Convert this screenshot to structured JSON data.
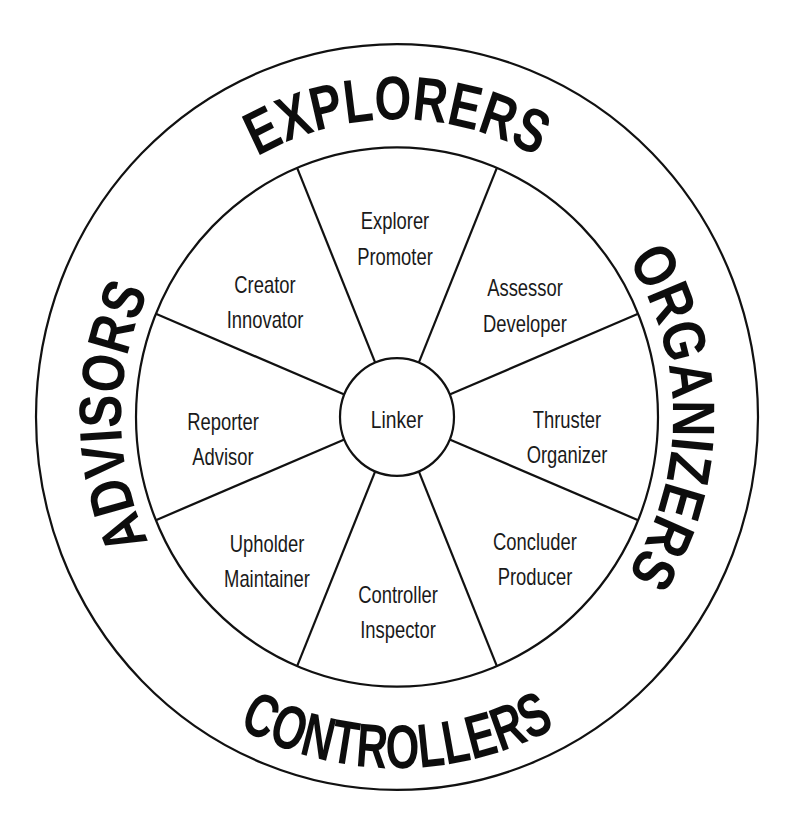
{
  "diagram": {
    "center": {
      "label": "Linker"
    },
    "groups": [
      {
        "id": "explorers",
        "label": "EXPLORERS",
        "position": "top"
      },
      {
        "id": "organizers",
        "label": "ORGANIZERS",
        "position": "right"
      },
      {
        "id": "controllers",
        "label": "CONTROLLERS",
        "position": "bottom"
      },
      {
        "id": "advisors",
        "label": "ADVISORS",
        "position": "left"
      }
    ],
    "sectors": [
      {
        "id": "explorer-promoter",
        "lines": [
          "Explorer",
          "Promoter"
        ],
        "position": "top"
      },
      {
        "id": "assessor-developer",
        "lines": [
          "Assessor",
          "Developer"
        ],
        "position": "top-right"
      },
      {
        "id": "thruster-organizer",
        "lines": [
          "Thruster",
          "Organizer"
        ],
        "position": "right"
      },
      {
        "id": "concluder-producer",
        "lines": [
          "Concluder",
          "Producer"
        ],
        "position": "bottom-right"
      },
      {
        "id": "controller-inspector",
        "lines": [
          "Controller",
          "Inspector"
        ],
        "position": "bottom"
      },
      {
        "id": "upholder-maintainer",
        "lines": [
          "Upholder",
          "Maintainer"
        ],
        "position": "bottom-left"
      },
      {
        "id": "reporter-advisor",
        "lines": [
          "Reporter",
          "Advisor"
        ],
        "position": "left"
      },
      {
        "id": "creator-innovator",
        "lines": [
          "Creator",
          "Innovator"
        ],
        "position": "top-left"
      }
    ],
    "colors": {
      "ink": "#111111",
      "background": "#ffffff"
    }
  }
}
